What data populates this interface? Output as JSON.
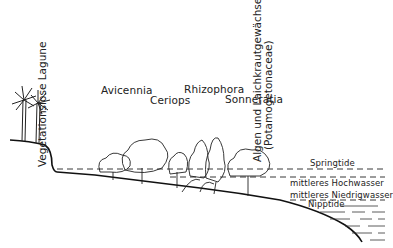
{
  "diagram": {
    "type": "mangrove zonation cross-section",
    "species_labels": [
      {
        "name": "Avicennia"
      },
      {
        "name": "Ceriops"
      },
      {
        "name": "Rhizophora"
      },
      {
        "name": "Sonneratia"
      }
    ],
    "vertical_labels": {
      "lagoon": "Vegetationslose Lagune",
      "algae_line1": "Algen und Laichkrautgewächse",
      "algae_line2": "(Potamogetonaceae)"
    },
    "water_levels": [
      {
        "name": "Springtide"
      },
      {
        "name": "mittleres Hochwasser"
      },
      {
        "name": "mittleres Niedrigwasser"
      },
      {
        "name": "Nipptide"
      }
    ]
  }
}
